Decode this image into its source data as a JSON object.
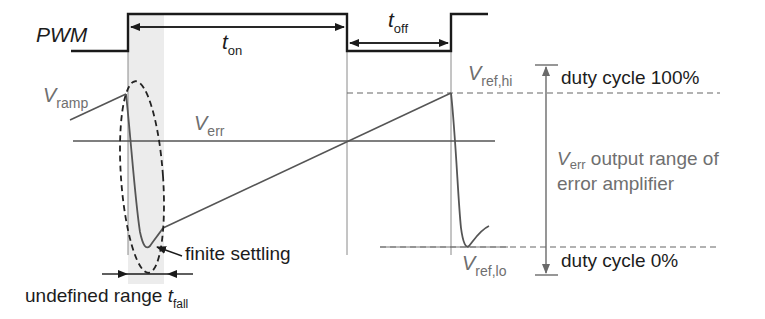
{
  "diagram": {
    "colors": {
      "pwm": "#1a1a1a",
      "signal": "#555555",
      "guide": "#8a8a8a",
      "shade": "#ececec",
      "label_gray": "#6f6f6f",
      "label_dark": "#1c1c1c"
    },
    "labels": {
      "pwm": "PWM",
      "t_on_main": "t",
      "t_on_sub": "on",
      "t_off_main": "t",
      "t_off_sub": "off",
      "v_ramp_main": "V",
      "v_ramp_sub": "ramp",
      "v_err_main": "V",
      "v_err_sub": "err",
      "v_ref_hi_main": "V",
      "v_ref_hi_sub": "ref,hi",
      "v_ref_lo_main": "V",
      "v_ref_lo_sub": "ref,lo",
      "duty_100": "duty cycle 100%",
      "duty_0": "duty cycle 0%",
      "range_v_main": "V",
      "range_v_sub": "err",
      "range_line1_rest": " output range of",
      "range_line2": "error amplifier",
      "finite_settling": "finite settling",
      "undefined_range": "undefined range ",
      "t_fall_main": "t",
      "t_fall_sub": "fall"
    }
  }
}
